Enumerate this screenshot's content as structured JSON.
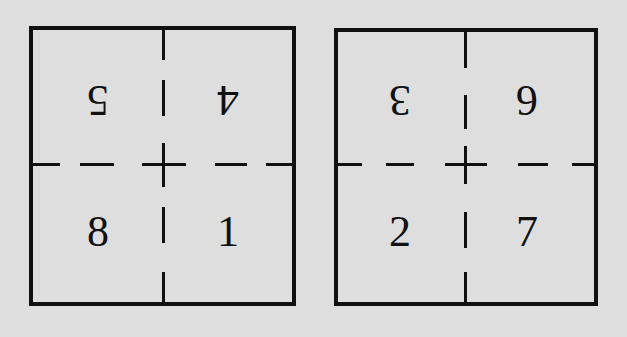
{
  "diagram": {
    "left_square": {
      "top_left": {
        "label": "5",
        "orientation": "upside-down"
      },
      "top_right": {
        "label": "4",
        "orientation": "upside-down"
      },
      "bottom_left": {
        "label": "8",
        "orientation": "upright"
      },
      "bottom_right": {
        "label": "1",
        "orientation": "upright"
      }
    },
    "right_square": {
      "top_left": {
        "label": "3",
        "orientation": "upside-down"
      },
      "top_right": {
        "label": "6",
        "orientation": "upside-down"
      },
      "bottom_left": {
        "label": "2",
        "orientation": "upright"
      },
      "bottom_right": {
        "label": "7",
        "orientation": "upright"
      }
    },
    "colors": {
      "background": "#dedede",
      "ink": "#111111"
    }
  }
}
